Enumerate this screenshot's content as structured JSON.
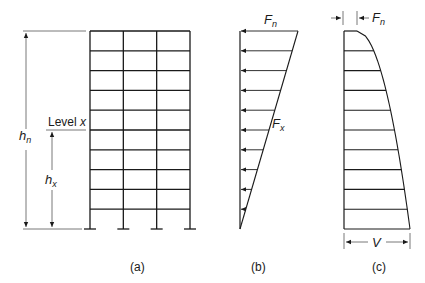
{
  "figure": {
    "panel_a": {
      "caption": "(a)",
      "label_hn": "h",
      "label_hn_sub": "n",
      "label_hx": "h",
      "label_hx_sub": "x",
      "level_label": "Level ",
      "level_var": "x",
      "stories": 10,
      "bays": 3
    },
    "panel_b": {
      "caption": "(b)",
      "top_force": "F",
      "top_force_sub": "n",
      "level_force": "F",
      "level_force_sub": "x",
      "arrow_count": 10
    },
    "panel_c": {
      "caption": "(c)",
      "top_shear": "F",
      "top_shear_sub": "n",
      "base_shear": "V",
      "levels": 10
    }
  }
}
